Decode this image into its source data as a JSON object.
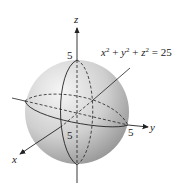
{
  "figure": {
    "equation": {
      "x": "x",
      "y": "y",
      "z": "z",
      "exp": "2",
      "plus": "+",
      "equals": "=",
      "rhs": "25",
      "full_text": "x² + y² + z² = 25"
    },
    "axes": {
      "x_label": "x",
      "y_label": "y",
      "z_label": "z"
    },
    "intercepts": {
      "z_top": "5",
      "y_right": "5",
      "x_front": "5"
    },
    "colors": {
      "sphere_light": "#f2f2f2",
      "sphere_dark": "#9a9a9a",
      "line": "#2a2a2a"
    }
  }
}
